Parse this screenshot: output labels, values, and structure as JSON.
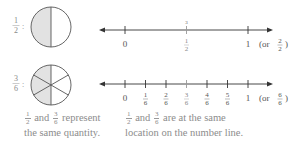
{
  "diagram": {
    "rows": [
      {
        "label": {
          "num": "1",
          "den": "2"
        },
        "circle": {
          "sectors": 2,
          "shaded": 1,
          "shade_color": "#e2e2e2"
        },
        "number_line": {
          "ticks": [
            {
              "pos": 0,
              "label": "0"
            },
            {
              "pos": 0.5,
              "label_num": "1",
              "label_den": "2",
              "above_num": "3",
              "above_den": "6"
            },
            {
              "pos": 1,
              "label": "1"
            }
          ],
          "equiv": {
            "prefix": "(or",
            "num": "2",
            "den": "2",
            "suffix": ")"
          }
        }
      },
      {
        "label": {
          "num": "3",
          "den": "6"
        },
        "circle": {
          "sectors": 6,
          "shaded": 3,
          "shade_color": "#e2e2e2"
        },
        "number_line": {
          "ticks": [
            {
              "pos": 0,
              "label": "0"
            },
            {
              "pos": 0.1667,
              "label_num": "1",
              "label_den": "6"
            },
            {
              "pos": 0.3333,
              "label_num": "2",
              "label_den": "6"
            },
            {
              "pos": 0.5,
              "label_num": "3",
              "label_den": "6"
            },
            {
              "pos": 0.6667,
              "label_num": "4",
              "label_den": "6"
            },
            {
              "pos": 0.8333,
              "label_num": "5",
              "label_den": "6"
            },
            {
              "pos": 1,
              "label": "1"
            }
          ],
          "equiv": {
            "prefix": "(or",
            "num": "6",
            "den": "6",
            "suffix": ")"
          }
        }
      }
    ],
    "captions": {
      "left": {
        "frac1": {
          "num": "1",
          "den": "2"
        },
        "and": "and",
        "frac2": {
          "num": "3",
          "den": "6"
        },
        "line1_rest": "represent",
        "line2": "the same quantity."
      },
      "right": {
        "frac1": {
          "num": "1",
          "den": "2"
        },
        "and": "and",
        "frac2": {
          "num": "3",
          "den": "6"
        },
        "line1_rest": "are at the same",
        "line2": "location on the number line."
      }
    }
  }
}
